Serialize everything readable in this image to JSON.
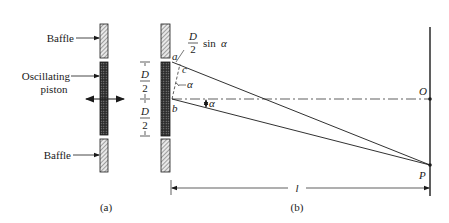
{
  "figure_a": {
    "caption": "(a)",
    "labels": {
      "baffle_top": "Baffle",
      "piston_line1": "Oscillating",
      "piston_line2": "piston",
      "baffle_bottom": "Baffle"
    }
  },
  "figure_b": {
    "caption": "(b)",
    "dimension": {
      "D": "D",
      "two": "2"
    },
    "path_difference": {
      "D": "D",
      "two": "2",
      "sin": "sin",
      "alpha": "α"
    },
    "points": {
      "a": "a",
      "b": "b",
      "c": "c",
      "O": "O",
      "P": "P"
    },
    "angle_label": "α",
    "angle_label_center": "α",
    "distance_label": "l"
  },
  "colors": {
    "ink": "#1a1a1a",
    "hatch": "#555555",
    "piston_fill": "#3a3a3a",
    "background": "#ffffff"
  }
}
